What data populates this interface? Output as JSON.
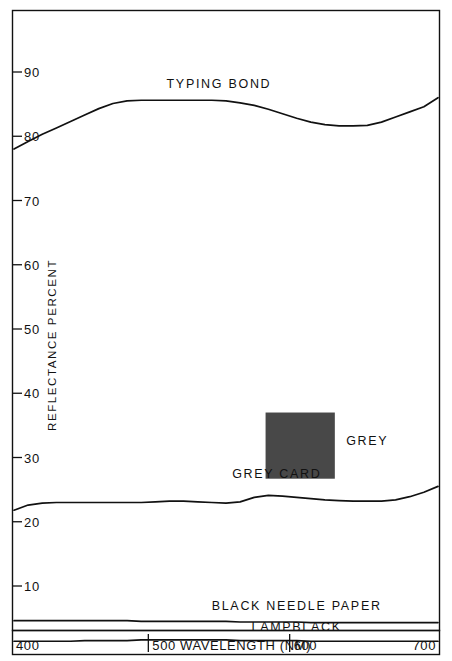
{
  "chart_data": {
    "type": "line",
    "title": "",
    "xlabel": "WAVELENGTH (NM)",
    "ylabel": "REFLECTANCE PERCENT",
    "xlim": [
      400,
      700
    ],
    "ylim": [
      0,
      95
    ],
    "grid": false,
    "legend_position": "inline-annotations",
    "x_tick_labels": [
      "400",
      "500",
      "600",
      "700"
    ],
    "x_ticks": [
      400,
      500,
      600,
      700
    ],
    "y_tick_labels": [
      "10",
      "20",
      "30",
      "40",
      "50",
      "60",
      "70",
      "80",
      "90"
    ],
    "y_ticks": [
      10,
      20,
      30,
      40,
      50,
      60,
      70,
      80,
      90
    ],
    "x": [
      400,
      410,
      420,
      430,
      440,
      450,
      460,
      470,
      480,
      490,
      500,
      510,
      520,
      530,
      540,
      550,
      560,
      570,
      580,
      590,
      600,
      610,
      620,
      630,
      640,
      650,
      660,
      670,
      680,
      690,
      700
    ],
    "series": [
      {
        "name": "TYPING BOND",
        "values": [
          78.0,
          79.2,
          80.3,
          81.3,
          82.3,
          83.3,
          84.3,
          85.1,
          85.5,
          85.6,
          85.6,
          85.6,
          85.6,
          85.6,
          85.6,
          85.5,
          85.2,
          84.8,
          84.2,
          83.5,
          82.8,
          82.2,
          81.8,
          81.6,
          81.6,
          81.7,
          82.2,
          83.0,
          83.8,
          84.6,
          86.0
        ],
        "label_x": 545,
        "label_y": 87.5
      },
      {
        "name": "GREY CARD",
        "values": [
          21.8,
          22.6,
          22.9,
          23.0,
          23.0,
          23.0,
          23.0,
          23.0,
          23.0,
          23.0,
          23.1,
          23.2,
          23.2,
          23.1,
          23.0,
          22.9,
          23.1,
          23.8,
          24.1,
          24.0,
          23.8,
          23.6,
          23.4,
          23.3,
          23.2,
          23.2,
          23.2,
          23.4,
          23.9,
          24.6,
          25.5
        ],
        "label_x": 586,
        "label_y": 26.8
      },
      {
        "name": "BLACK NEEDLE PAPER",
        "values": [
          4.6,
          4.6,
          4.6,
          4.6,
          4.6,
          4.6,
          4.6,
          4.6,
          4.6,
          4.5,
          4.5,
          4.5,
          4.5,
          4.5,
          4.5,
          4.5,
          4.4,
          4.4,
          4.4,
          4.4,
          4.4,
          4.3,
          4.3,
          4.3,
          4.3,
          4.3,
          4.3,
          4.3,
          4.3,
          4.3,
          4.3
        ],
        "label_x": 600,
        "label_y": 6.2
      },
      {
        "name": "LAMPBLACK",
        "values": [
          1.4,
          1.4,
          1.4,
          1.4,
          1.4,
          1.5,
          1.5,
          1.5,
          1.5,
          1.6,
          1.6,
          1.6,
          1.6,
          1.6,
          1.6,
          1.6,
          1.5,
          1.5,
          1.5,
          1.5,
          1.5,
          1.4,
          1.4,
          1.4,
          1.4,
          1.4,
          1.4,
          1.4,
          1.4,
          1.4,
          1.4
        ],
        "label_x": 600,
        "label_y": 3.0
      }
    ],
    "annotations": [
      {
        "name": "grey-swatch",
        "label": "GREY",
        "color": "#484848",
        "x_start": 578,
        "x_end": 627,
        "y_top": 37.0,
        "y_bottom": 26.7,
        "label_x": 635,
        "label_y": 32.0
      }
    ]
  },
  "axis": {
    "y_title": "REFLECTANCE PERCENT",
    "x_title": "WAVELENGTH (NM)",
    "x_axis_row": {
      "start_label": "400",
      "mid_label": "500 WAVELENGTH (NM)",
      "mid_tick_label": "500",
      "second_tick_label": "600",
      "end_label": "700"
    }
  },
  "colors": {
    "ink": "#111111",
    "paper": "#ffffff",
    "grey_swatch": "#484848"
  }
}
